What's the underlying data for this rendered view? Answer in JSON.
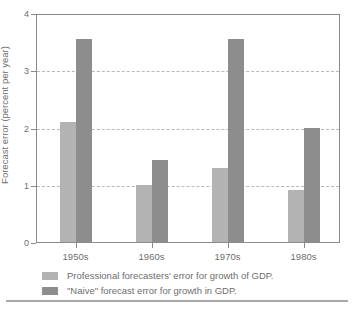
{
  "chart_data": {
    "type": "bar",
    "title": "",
    "subtitle": "",
    "xlabel": "",
    "ylabel": "Forecast error (percent per year)",
    "categories": [
      "1950s",
      "1960s",
      "1970s",
      "1980s"
    ],
    "series": [
      {
        "name": "Professional forecasters' error for growth of GDP.",
        "key": "professional",
        "color": "#b3b3b3",
        "values": [
          2.1,
          1.0,
          1.3,
          0.9
        ]
      },
      {
        "name": "\"Naive\" forecast error for growth in GDP.",
        "key": "naive",
        "color": "#8d8d8d",
        "values": [
          3.55,
          1.43,
          3.55,
          2.0
        ]
      }
    ],
    "ylim": [
      0,
      4
    ],
    "ytick_values": [
      0,
      1,
      2,
      3,
      4
    ],
    "ytick_labels": [
      "0",
      "1",
      "2",
      "3",
      "4"
    ],
    "grid": true,
    "grid_axis": "y",
    "grid_style": "dashed",
    "grid_color": "#b9b9b9",
    "legend_position": "below-axes",
    "axis_color": "#8a8a8a",
    "background_color": "#ffffff",
    "text_color": "#6e6e6e"
  },
  "axes": {
    "y": {
      "label": "Forecast error (percent per year)",
      "ticks": [
        {
          "value": 4,
          "label": "4"
        },
        {
          "value": 3,
          "label": "3"
        },
        {
          "value": 2,
          "label": "2"
        },
        {
          "value": 1,
          "label": "1"
        },
        {
          "value": 0,
          "label": "0"
        }
      ]
    },
    "x": {
      "label": "",
      "ticks": [
        {
          "label": "1950s"
        },
        {
          "label": "1960s"
        },
        {
          "label": "1970s"
        },
        {
          "label": "1980s"
        }
      ]
    }
  },
  "legend": {
    "items": [
      {
        "label": "Professional forecasters' error for growth of GDP.",
        "color": "#b3b3b3"
      },
      {
        "label": "\"Naive\" forecast error for growth in GDP.",
        "color": "#8d8d8d"
      }
    ]
  }
}
